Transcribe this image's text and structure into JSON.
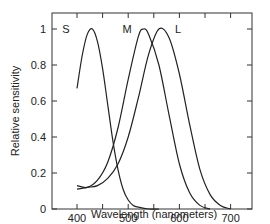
{
  "chart_data": {
    "type": "line",
    "title": "",
    "xlabel": "Wavelength (nanometers)",
    "ylabel": "Relative sensitivity",
    "xlim": [
      350,
      750
    ],
    "ylim": [
      0,
      1.1
    ],
    "xticks": [
      400,
      500,
      600,
      700
    ],
    "xticks_minor": [
      450,
      550,
      650
    ],
    "yticks": [
      0,
      0.2,
      0.4,
      0.6,
      0.8,
      1
    ],
    "ytick_labels": [
      "0",
      "0.2",
      "0.4",
      "0.6",
      "0.8",
      "1"
    ],
    "grid": false,
    "legend": "inline labels above peaks",
    "series": [
      {
        "name": "S",
        "peak_nm": 430,
        "x": [
          400,
          410,
          420,
          430,
          440,
          450,
          460,
          470,
          480,
          490,
          500,
          510,
          520,
          540,
          560
        ],
        "y": [
          0.67,
          0.85,
          0.97,
          1.0,
          0.93,
          0.78,
          0.58,
          0.38,
          0.22,
          0.11,
          0.05,
          0.02,
          0.01,
          0.0,
          0.0
        ]
      },
      {
        "name": "M",
        "peak_nm": 530,
        "x": [
          400,
          420,
          440,
          460,
          480,
          500,
          520,
          530,
          540,
          560,
          580,
          600,
          620,
          640,
          660
        ],
        "y": [
          0.13,
          0.12,
          0.16,
          0.26,
          0.45,
          0.72,
          0.96,
          1.0,
          0.97,
          0.8,
          0.52,
          0.25,
          0.09,
          0.02,
          0.0
        ]
      },
      {
        "name": "L",
        "peak_nm": 560,
        "x": [
          400,
          420,
          440,
          460,
          480,
          500,
          520,
          540,
          560,
          580,
          600,
          620,
          640,
          660,
          680,
          700
        ],
        "y": [
          0.11,
          0.12,
          0.13,
          0.17,
          0.25,
          0.4,
          0.62,
          0.86,
          1.0,
          0.95,
          0.75,
          0.47,
          0.22,
          0.08,
          0.02,
          0.0
        ]
      }
    ]
  }
}
